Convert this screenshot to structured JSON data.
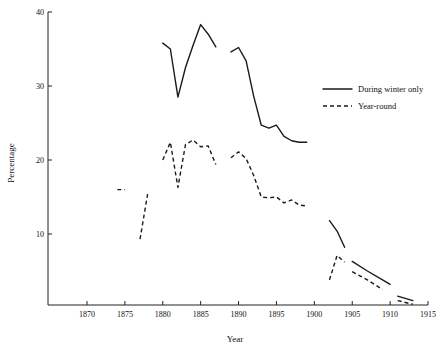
{
  "chart_data": {
    "type": "line",
    "title": "",
    "xlabel": "Year",
    "ylabel": "Percentage",
    "xlim": [
      1866,
      1915
    ],
    "ylim": [
      0,
      40
    ],
    "xticks": [
      1870,
      1875,
      1880,
      1885,
      1890,
      1895,
      1900,
      1905,
      1910,
      1915
    ],
    "yticks": [
      10,
      20,
      30,
      40
    ],
    "grid": false,
    "legend_position": "right-center",
    "series": [
      {
        "name": "During winter only",
        "style": "solid",
        "segments": [
          {
            "x": [
              1880,
              1881,
              1882,
              1883,
              1884,
              1885,
              1886,
              1887
            ],
            "y": [
              35.8,
              35.0,
              28.5,
              32.5,
              35.5,
              38.3,
              37.0,
              35.3
            ]
          },
          {
            "x": [
              1889,
              1890,
              1891,
              1892,
              1893,
              1894,
              1895,
              1896,
              1897,
              1898,
              1899
            ],
            "y": [
              34.6,
              35.2,
              33.4,
              28.6,
              24.7,
              24.3,
              24.7,
              23.2,
              22.6,
              22.4,
              22.4
            ]
          },
          {
            "x": [
              1902,
              1903,
              1904
            ],
            "y": [
              11.8,
              10.4,
              8.2
            ]
          },
          {
            "x": [
              1905,
              1907,
              1909,
              1910
            ],
            "y": [
              6.3,
              5.0,
              3.8,
              3.2
            ]
          },
          {
            "x": [
              1911,
              1913
            ],
            "y": [
              1.6,
              1.0
            ]
          }
        ]
      },
      {
        "name": "Year-round",
        "style": "dashed",
        "segments": [
          {
            "x": [
              1874,
              1875
            ],
            "y": [
              16.0,
              16.0
            ]
          },
          {
            "x": [
              1877,
              1878
            ],
            "y": [
              9.3,
              15.4
            ]
          },
          {
            "x": [
              1880,
              1881,
              1882,
              1883,
              1884,
              1885,
              1886,
              1887
            ],
            "y": [
              20.0,
              22.4,
              16.3,
              22.1,
              22.7,
              21.8,
              21.9,
              19.4
            ]
          },
          {
            "x": [
              1889,
              1890,
              1891,
              1892,
              1893,
              1894,
              1895,
              1896,
              1897,
              1898,
              1899
            ],
            "y": [
              20.3,
              21.1,
              20.2,
              17.9,
              15.0,
              14.9,
              15.0,
              14.2,
              14.6,
              13.9,
              13.8
            ]
          },
          {
            "x": [
              1902,
              1903,
              1904
            ],
            "y": [
              3.8,
              7.1,
              6.2
            ]
          },
          {
            "x": [
              1905,
              1907,
              1909
            ],
            "y": [
              4.9,
              3.8,
              2.5
            ]
          },
          {
            "x": [
              1911,
              1913
            ],
            "y": [
              1.0,
              0.5
            ]
          }
        ]
      }
    ]
  },
  "legend": {
    "entries": [
      {
        "label": "During winter only",
        "style": "solid"
      },
      {
        "label": "Year-round",
        "style": "dashed"
      }
    ]
  }
}
